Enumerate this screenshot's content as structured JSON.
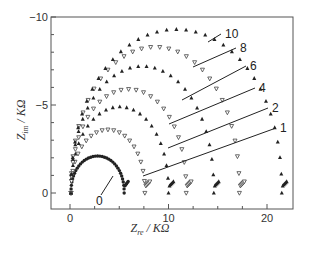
{
  "chart_data": {
    "type": "scatter",
    "title": "",
    "xlabel": "Z_re / KΩ",
    "ylabel": "Z_im / KΩ",
    "xlabel_main": "Z",
    "xlabel_sub": "re",
    "xlabel_unit": " / KΩ",
    "ylabel_main": "Z",
    "ylabel_sub": "im",
    "ylabel_unit": " / KΩ",
    "xlim": [
      -2,
      23
    ],
    "ylim": [
      0.9,
      -10
    ],
    "x_ticks": [
      0,
      10,
      20
    ],
    "x_minor_ticks": [
      2.5,
      5,
      7.5,
      12.5,
      15,
      17.5
    ],
    "y_ticks": [
      -10,
      -5,
      0
    ],
    "y_tick_labels": [
      "-10",
      "-5",
      "0"
    ],
    "y_minor_ticks": [
      -9,
      -8,
      -7,
      -6,
      -4,
      -3,
      -2,
      -1
    ],
    "grid": false,
    "legend": "inline curve labels with leader arrows",
    "series": [
      {
        "name": "0",
        "marker": "filled-circle",
        "r_end": 5.5,
        "peak_im": -2.1,
        "tail": 0.4
      },
      {
        "name": "1",
        "marker": "open-triangle-down",
        "r_end": 7.6,
        "peak_im": -3.6,
        "tail": 0.5
      },
      {
        "name": "2",
        "marker": "filled-triangle-up",
        "r_end": 10.0,
        "peak_im": -4.9,
        "tail": 0.5
      },
      {
        "name": "4",
        "marker": "open-triangle-down",
        "r_end": 11.8,
        "peak_im": -5.9,
        "tail": 0.5
      },
      {
        "name": "6",
        "marker": "filled-triangle-up",
        "r_end": 14.6,
        "peak_im": -7.2,
        "tail": 0.5
      },
      {
        "name": "8",
        "marker": "open-triangle-down",
        "r_end": 17.2,
        "peak_im": -8.3,
        "tail": 0.5
      },
      {
        "name": "10",
        "marker": "filled-triangle-up",
        "r_end": 21.5,
        "peak_im": -9.3,
        "tail": 0.5
      }
    ],
    "annotations": [
      {
        "text": "0",
        "x_px": 96,
        "y_px": 205,
        "arrow_to": [
          113,
          176
        ]
      },
      {
        "text": "1",
        "x_px": 280,
        "y_px": 132,
        "arrow_to": [
          143,
          176
        ]
      },
      {
        "text": "2",
        "x_px": 272,
        "y_px": 112,
        "arrow_to": [
          168,
          148
        ]
      },
      {
        "text": "4",
        "x_px": 259,
        "y_px": 92,
        "arrow_to": [
          169,
          124
        ]
      },
      {
        "text": "6",
        "x_px": 250,
        "y_px": 70,
        "arrow_to": [
          182,
          100
        ]
      },
      {
        "text": "8",
        "x_px": 240,
        "y_px": 52,
        "arrow_to": [
          193,
          67
        ]
      },
      {
        "text": "10",
        "x_px": 225,
        "y_px": 38,
        "arrow_to": [
          208,
          42
        ]
      }
    ]
  }
}
